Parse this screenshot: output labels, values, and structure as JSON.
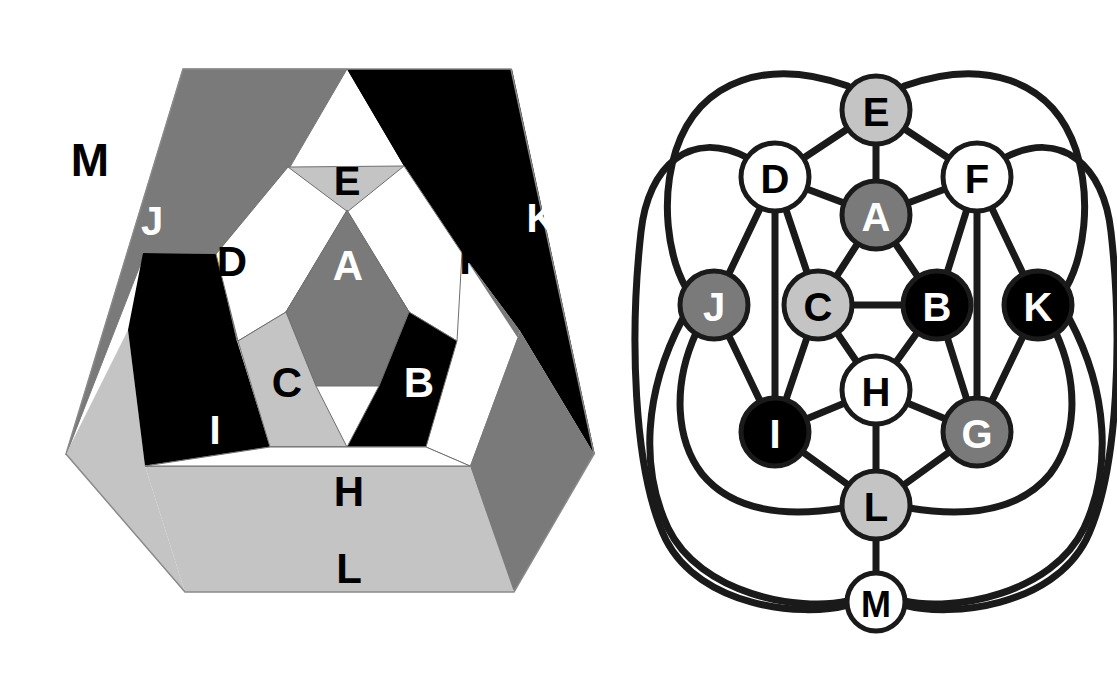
{
  "figure": {
    "left_panel": {
      "name": "schlegel-hexagon-map",
      "description": "Hexagonal planar map of the 12 faces of a dodecahedron, each face labelled with a letter and shaded.",
      "outer_label": "M",
      "faces": [
        {
          "id": "A",
          "label": "A",
          "fill": "#7a7a7a",
          "text_color": "#ffffff",
          "region": "center"
        },
        {
          "id": "B",
          "label": "B",
          "fill": "#000000",
          "text_color": "#ffffff",
          "region": "inner-ring"
        },
        {
          "id": "C",
          "label": "C",
          "fill": "#c4c4c4",
          "text_color": "#000000",
          "region": "inner-ring"
        },
        {
          "id": "D",
          "label": "D",
          "fill": "#ffffff",
          "text_color": "#000000",
          "region": "inner-ring"
        },
        {
          "id": "E",
          "label": "E",
          "fill": "#c4c4c4",
          "text_color": "#000000",
          "region": "inner-ring"
        },
        {
          "id": "F",
          "label": "F",
          "fill": "#ffffff",
          "text_color": "#000000",
          "region": "inner-ring"
        },
        {
          "id": "G",
          "label": "G",
          "fill": "#7a7a7a",
          "text_color": "#ffffff",
          "region": "outer-ring"
        },
        {
          "id": "H",
          "label": "H",
          "fill": "#ffffff",
          "text_color": "#000000",
          "region": "inner-ring"
        },
        {
          "id": "I",
          "label": "I",
          "fill": "#000000",
          "text_color": "#ffffff",
          "region": "outer-ring"
        },
        {
          "id": "J",
          "label": "J",
          "fill": "#7a7a7a",
          "text_color": "#ffffff",
          "region": "outer-ring"
        },
        {
          "id": "K",
          "label": "K",
          "fill": "#000000",
          "text_color": "#ffffff",
          "region": "outer-ring"
        },
        {
          "id": "L",
          "label": "L",
          "fill": "#c4c4c4",
          "text_color": "#000000",
          "region": "outer-ring"
        },
        {
          "id": "M",
          "label": "M",
          "fill": "#ffffff",
          "text_color": "#000000",
          "region": "exterior"
        }
      ]
    },
    "right_panel": {
      "name": "adjacency-graph",
      "description": "Face-adjacency graph of the dodecahedron: 13 labelled nodes connected by straight edges and long wrapping curves.",
      "nodes": [
        {
          "id": "E",
          "label": "E",
          "x": 876,
          "y": 110,
          "r": 34,
          "fill": "#c4c4c4",
          "text_color": "#000000"
        },
        {
          "id": "D",
          "label": "D",
          "x": 775,
          "y": 177,
          "r": 34,
          "fill": "#ffffff",
          "text_color": "#000000"
        },
        {
          "id": "F",
          "label": "F",
          "x": 977,
          "y": 177,
          "r": 34,
          "fill": "#ffffff",
          "text_color": "#000000"
        },
        {
          "id": "A",
          "label": "A",
          "x": 876,
          "y": 215,
          "r": 34,
          "fill": "#7a7a7a",
          "text_color": "#ffffff"
        },
        {
          "id": "J",
          "label": "J",
          "x": 714,
          "y": 305,
          "r": 34,
          "fill": "#7a7a7a",
          "text_color": "#ffffff"
        },
        {
          "id": "C",
          "label": "C",
          "x": 818,
          "y": 305,
          "r": 34,
          "fill": "#c4c4c4",
          "text_color": "#000000"
        },
        {
          "id": "B",
          "label": "B",
          "x": 937,
          "y": 305,
          "r": 34,
          "fill": "#000000",
          "text_color": "#ffffff"
        },
        {
          "id": "K",
          "label": "K",
          "x": 1038,
          "y": 305,
          "r": 34,
          "fill": "#000000",
          "text_color": "#ffffff"
        },
        {
          "id": "H",
          "label": "H",
          "x": 876,
          "y": 390,
          "r": 34,
          "fill": "#ffffff",
          "text_color": "#000000"
        },
        {
          "id": "I",
          "label": "I",
          "x": 775,
          "y": 432,
          "r": 34,
          "fill": "#000000",
          "text_color": "#ffffff"
        },
        {
          "id": "G",
          "label": "G",
          "x": 977,
          "y": 432,
          "r": 34,
          "fill": "#7a7a7a",
          "text_color": "#ffffff"
        },
        {
          "id": "L",
          "label": "L",
          "x": 876,
          "y": 505,
          "r": 34,
          "fill": "#c4c4c4",
          "text_color": "#000000"
        },
        {
          "id": "M",
          "label": "M",
          "x": 876,
          "y": 602,
          "r": 29,
          "fill": "#ffffff",
          "text_color": "#000000"
        }
      ],
      "straight_edges": [
        [
          "E",
          "D"
        ],
        [
          "E",
          "A"
        ],
        [
          "E",
          "F"
        ],
        [
          "D",
          "A"
        ],
        [
          "D",
          "C"
        ],
        [
          "D",
          "J"
        ],
        [
          "D",
          "I"
        ],
        [
          "F",
          "A"
        ],
        [
          "F",
          "B"
        ],
        [
          "F",
          "K"
        ],
        [
          "F",
          "G"
        ],
        [
          "A",
          "C"
        ],
        [
          "A",
          "B"
        ],
        [
          "J",
          "I"
        ],
        [
          "C",
          "B"
        ],
        [
          "C",
          "I"
        ],
        [
          "C",
          "H"
        ],
        [
          "B",
          "G"
        ],
        [
          "B",
          "H"
        ],
        [
          "K",
          "G"
        ],
        [
          "H",
          "I"
        ],
        [
          "H",
          "G"
        ],
        [
          "H",
          "L"
        ],
        [
          "I",
          "L"
        ],
        [
          "G",
          "L"
        ],
        [
          "L",
          "M"
        ]
      ],
      "curved_edges": [
        [
          "E",
          "J"
        ],
        [
          "E",
          "K"
        ],
        [
          "J",
          "M"
        ],
        [
          "K",
          "M"
        ],
        [
          "J",
          "L"
        ],
        [
          "K",
          "L"
        ],
        [
          "D",
          "M"
        ],
        [
          "F",
          "M"
        ]
      ]
    },
    "palette": {
      "white": "#ffffff",
      "light_gray": "#c4c4c4",
      "mid_gray": "#7a7a7a",
      "black": "#000000",
      "stroke": "#1a1a1a"
    }
  }
}
